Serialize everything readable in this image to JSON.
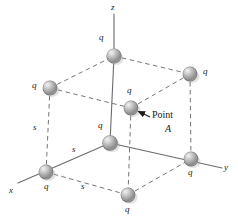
{
  "figure": {
    "background": "#ffffff",
    "sphere_color": "#9a9a9a",
    "sphere_highlight": "#e8e8e8",
    "line_color": "#6b6b6b",
    "text_color": "#1a1a1a",
    "axes": [
      {
        "name": "z",
        "label": "z",
        "label_x": 111,
        "label_y": 5
      },
      {
        "name": "x",
        "label": "x",
        "label_x": 9,
        "label_y": 187
      },
      {
        "name": "y",
        "label": "y",
        "label_x": 224,
        "label_y": 164
      }
    ],
    "charges": [
      {
        "id": "top-back-left",
        "label": "q",
        "cx": 50,
        "cy": 88,
        "label_x": 34,
        "label_y": 82
      },
      {
        "id": "top-back-top",
        "label": "q",
        "cx": 114,
        "cy": 56,
        "label_x": 99,
        "label_y": 36
      },
      {
        "id": "top-back-right",
        "label": "q",
        "cx": 190,
        "cy": 74,
        "label_x": 202,
        "label_y": 69
      },
      {
        "id": "top-front",
        "label": "q",
        "cx": 131,
        "cy": 108,
        "label_x": 126,
        "label_y": 89
      },
      {
        "id": "bottom-left",
        "label": "q",
        "cx": 46,
        "cy": 172,
        "label_x": 44,
        "label_y": 183
      },
      {
        "id": "origin",
        "label": "q",
        "cx": 110,
        "cy": 143,
        "label_x": 98,
        "label_y": 124
      },
      {
        "id": "bottom-right",
        "label": "q",
        "cx": 191,
        "cy": 159,
        "label_x": 188,
        "label_y": 170
      },
      {
        "id": "bottom-front",
        "label": "q",
        "cx": 128,
        "cy": 195,
        "label_x": 125,
        "label_y": 206
      }
    ],
    "edge_labels": [
      {
        "id": "s-vertical",
        "label": "s",
        "x": 34,
        "y": 125
      },
      {
        "id": "s-diagonal",
        "label": "s",
        "x": 73,
        "y": 147
      },
      {
        "id": "s-bottom",
        "label": "s",
        "x": 82,
        "y": 184
      }
    ],
    "annotation": {
      "line1": "Point",
      "line2": "A",
      "line1_x": 152,
      "line1_y": 112,
      "line2_x": 164,
      "line2_y": 126,
      "arrow_from_x": 150,
      "arrow_from_y": 117,
      "arrow_to_x": 137,
      "arrow_to_y": 111
    }
  }
}
